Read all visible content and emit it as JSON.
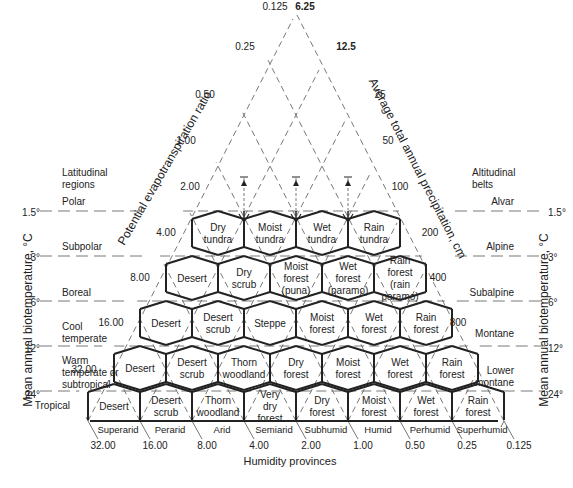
{
  "diagram": {
    "colors": {
      "ink": "#222222",
      "dash": "#555555",
      "background": "#ffffff"
    },
    "top_labels": {
      "left": "0.125",
      "right": "6.25"
    },
    "pet_axis": {
      "title": "Potential evapotranspiration ratio",
      "ticks": [
        "0.25",
        "0.50",
        "1.00",
        "2.00",
        "4.00",
        "8.00",
        "16.00",
        "32.00"
      ]
    },
    "precip_axis": {
      "title": "Average total annual precipitation, cm",
      "ticks": [
        "12.5",
        "25",
        "50",
        "100",
        "200",
        "400",
        "800"
      ]
    },
    "left_axis": {
      "title": "Mean annual biotemperature, °C",
      "header": [
        "Latitudinal",
        "regions"
      ],
      "regions": [
        {
          "name": "Polar",
          "temp": "1.5°"
        },
        {
          "name": "Subpolar",
          "temp": "3°"
        },
        {
          "name": "Boreal",
          "temp": "6°"
        },
        {
          "name": "Cool temperate",
          "lines": [
            "Cool",
            "temperate"
          ],
          "temp": "12°"
        },
        {
          "name": "Warm temperate or subtropical",
          "lines": [
            "Warm",
            "temperate or",
            "subtropical"
          ],
          "temp": "24°"
        },
        {
          "name": "Tropical",
          "temp": ""
        }
      ]
    },
    "right_axis": {
      "title": "Mean annual biotemperature, °C",
      "header": [
        "Altitudinal",
        "belts"
      ],
      "belts": [
        {
          "name": "Alvar",
          "temp": "1.5°"
        },
        {
          "name": "Alpine",
          "temp": "3°"
        },
        {
          "name": "Subalpine",
          "temp": "6°"
        },
        {
          "name": "Montane",
          "temp": "12°"
        },
        {
          "name": "Lower montane",
          "lines": [
            "Lower",
            "montane"
          ],
          "temp": "24°"
        }
      ]
    },
    "bottom": {
      "title": "Humidity provinces",
      "provinces": [
        "Superarid",
        "Perarid",
        "Arid",
        "Semiarid",
        "Subhumid",
        "Humid",
        "Perhumid",
        "Superhumid"
      ],
      "ticks": [
        "32.00",
        "16.00",
        "8.00",
        "4.00",
        "2.00",
        "1.00",
        "0.50",
        "0.25",
        "0.125"
      ]
    },
    "zones": {
      "row1": [
        [
          "Dry",
          "tundra"
        ],
        [
          "Moist",
          "tundra"
        ],
        [
          "Wet",
          "tundra"
        ],
        [
          "Rain",
          "tundra"
        ]
      ],
      "row2": [
        [
          "Desert"
        ],
        [
          "Dry",
          "scrub"
        ],
        [
          "Moist",
          "forest",
          "(puna)"
        ],
        [
          "Wet",
          "forest",
          "(paramo)"
        ],
        [
          "Rain",
          "forest",
          "(rain",
          "paramo)"
        ]
      ],
      "row3": [
        [
          "Desert"
        ],
        [
          "Desert",
          "scrub"
        ],
        [
          "Steppe"
        ],
        [
          "Moist",
          "forest"
        ],
        [
          "Wet",
          "forest"
        ],
        [
          "Rain",
          "forest"
        ]
      ],
      "row4": [
        [
          "Desert"
        ],
        [
          "Desert",
          "scrub"
        ],
        [
          "Thorn",
          "woodland"
        ],
        [
          "Dry",
          "forest"
        ],
        [
          "Moist",
          "forest"
        ],
        [
          "Wet",
          "forest"
        ],
        [
          "Rain",
          "forest"
        ]
      ],
      "row5": [
        [
          "Desert"
        ],
        [
          "Desert",
          "scrub"
        ],
        [
          "Thorn",
          "woodland"
        ],
        [
          "Very",
          "dry",
          "forest"
        ],
        [
          "Dry",
          "forest"
        ],
        [
          "Moist",
          "forest"
        ],
        [
          "Wet",
          "forest"
        ],
        [
          "Rain",
          "forest"
        ]
      ]
    }
  }
}
